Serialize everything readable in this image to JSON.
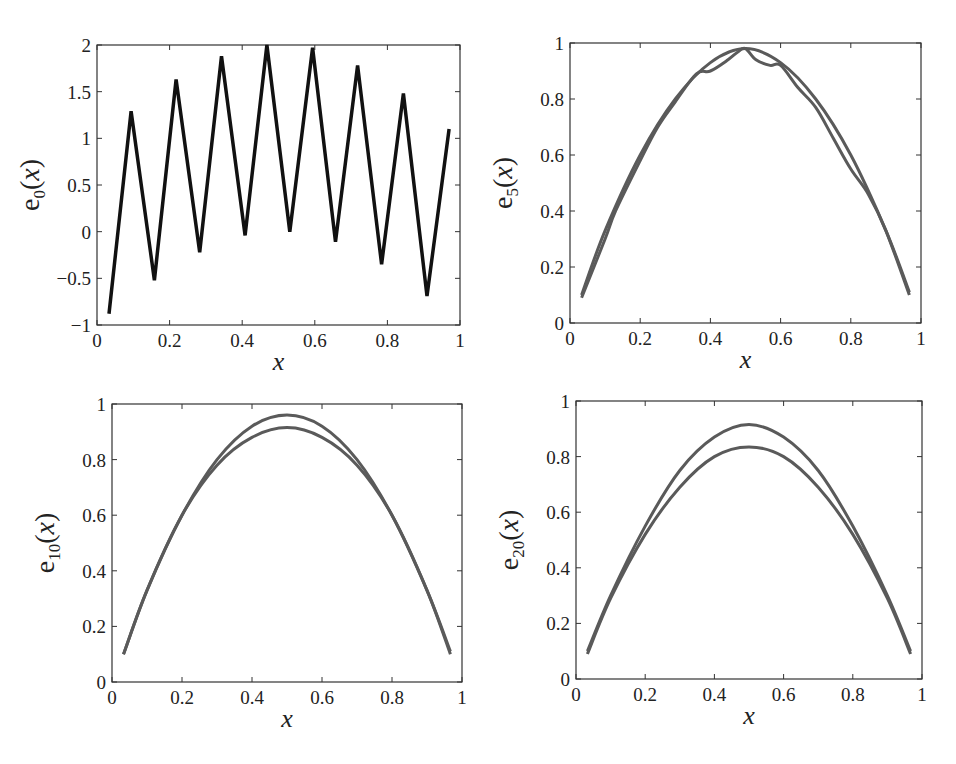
{
  "chart_data": [
    {
      "type": "line",
      "title": "",
      "xlabel": "x",
      "ylabel": "e_0(x)",
      "ylabel_base": "e",
      "ylabel_sub": "0",
      "xlim": [
        0,
        1
      ],
      "ylim": [
        -1,
        2
      ],
      "xticks": [
        "0",
        "0.2",
        "0.4",
        "0.6",
        "0.8",
        "1"
      ],
      "yticks": [
        "-1",
        "-0.5",
        "0",
        "0.5",
        "1",
        "1.5",
        "2"
      ],
      "grid": false,
      "line_color": "#111111",
      "series": [
        {
          "name": "e0",
          "x": [
            0.033,
            0.094,
            0.158,
            0.218,
            0.283,
            0.343,
            0.408,
            0.468,
            0.531,
            0.594,
            0.657,
            0.718,
            0.784,
            0.844,
            0.909,
            0.97
          ],
          "y": [
            -0.88,
            1.29,
            -0.52,
            1.63,
            -0.22,
            1.88,
            -0.04,
            2.0,
            0.0,
            1.97,
            -0.11,
            1.78,
            -0.35,
            1.48,
            -0.69,
            1.1
          ]
        }
      ]
    },
    {
      "type": "line",
      "title": "",
      "xlabel": "x",
      "ylabel": "e_5(x)",
      "ylabel_base": "e",
      "ylabel_sub": "5",
      "xlim": [
        0,
        1
      ],
      "ylim": [
        0,
        1
      ],
      "xticks": [
        "0",
        "0.2",
        "0.4",
        "0.6",
        "0.8",
        "1"
      ],
      "yticks": [
        "0",
        "0.2",
        "0.4",
        "0.6",
        "0.8",
        "1"
      ],
      "grid": false,
      "line_color": "#5a5a5a",
      "series": [
        {
          "name": "smooth",
          "x": [
            0.033,
            0.1,
            0.2,
            0.3,
            0.4,
            0.5,
            0.6,
            0.7,
            0.8,
            0.9,
            0.967
          ],
          "y": [
            0.1,
            0.33,
            0.6,
            0.8,
            0.93,
            0.98,
            0.93,
            0.8,
            0.6,
            0.33,
            0.11
          ]
        },
        {
          "name": "oscillating",
          "x": [
            0.033,
            0.1,
            0.13,
            0.2,
            0.25,
            0.3,
            0.36,
            0.4,
            0.45,
            0.48,
            0.5,
            0.53,
            0.57,
            0.6,
            0.65,
            0.7,
            0.75,
            0.8,
            0.85,
            0.9,
            0.967
          ],
          "y": [
            0.09,
            0.3,
            0.4,
            0.58,
            0.7,
            0.79,
            0.89,
            0.9,
            0.94,
            0.97,
            0.98,
            0.94,
            0.92,
            0.92,
            0.84,
            0.77,
            0.66,
            0.55,
            0.46,
            0.33,
            0.1
          ]
        }
      ]
    },
    {
      "type": "line",
      "title": "",
      "xlabel": "x",
      "ylabel": "e_10(x)",
      "ylabel_base": "e",
      "ylabel_sub": "10",
      "xlim": [
        0,
        1
      ],
      "ylim": [
        0,
        1
      ],
      "xticks": [
        "0",
        "0.2",
        "0.4",
        "0.6",
        "0.8",
        "1"
      ],
      "yticks": [
        "0",
        "0.2",
        "0.4",
        "0.6",
        "0.8",
        "1"
      ],
      "grid": false,
      "line_color": "#5a5a5a",
      "series": [
        {
          "name": "upper",
          "x": [
            0.033,
            0.1,
            0.2,
            0.3,
            0.4,
            0.5,
            0.6,
            0.7,
            0.8,
            0.9,
            0.967
          ],
          "y": [
            0.1,
            0.33,
            0.6,
            0.8,
            0.92,
            0.96,
            0.92,
            0.8,
            0.6,
            0.33,
            0.11
          ]
        },
        {
          "name": "lower",
          "x": [
            0.033,
            0.1,
            0.2,
            0.3,
            0.4,
            0.5,
            0.6,
            0.7,
            0.8,
            0.9,
            0.967
          ],
          "y": [
            0.1,
            0.33,
            0.6,
            0.78,
            0.88,
            0.915,
            0.88,
            0.78,
            0.6,
            0.33,
            0.1
          ]
        }
      ]
    },
    {
      "type": "line",
      "title": "",
      "xlabel": "x",
      "ylabel": "e_20(x)",
      "ylabel_base": "e",
      "ylabel_sub": "20",
      "xlim": [
        0,
        1
      ],
      "ylim": [
        0,
        1
      ],
      "xticks": [
        "0",
        "0.2",
        "0.4",
        "0.6",
        "0.8",
        "1"
      ],
      "yticks": [
        "0",
        "0.2",
        "0.4",
        "0.6",
        "0.8",
        "1"
      ],
      "grid": false,
      "line_color": "#5a5a5a",
      "series": [
        {
          "name": "upper",
          "x": [
            0.033,
            0.1,
            0.2,
            0.3,
            0.4,
            0.5,
            0.6,
            0.7,
            0.8,
            0.9,
            0.967
          ],
          "y": [
            0.1,
            0.3,
            0.55,
            0.75,
            0.87,
            0.915,
            0.87,
            0.75,
            0.55,
            0.3,
            0.1
          ]
        },
        {
          "name": "lower",
          "x": [
            0.033,
            0.1,
            0.2,
            0.3,
            0.4,
            0.5,
            0.6,
            0.7,
            0.8,
            0.9,
            0.967
          ],
          "y": [
            0.09,
            0.29,
            0.52,
            0.69,
            0.8,
            0.835,
            0.8,
            0.69,
            0.52,
            0.29,
            0.09
          ]
        }
      ]
    }
  ],
  "layout": {
    "panels": [
      {
        "left": 97,
        "top": 45,
        "right": 460,
        "bottom": 325
      },
      {
        "left": 570,
        "top": 43,
        "right": 921,
        "bottom": 323
      },
      {
        "left": 112,
        "top": 404,
        "right": 462,
        "bottom": 682
      },
      {
        "left": 576,
        "top": 401,
        "right": 922,
        "bottom": 679
      }
    ]
  }
}
